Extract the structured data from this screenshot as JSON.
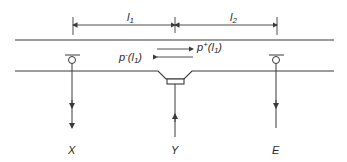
{
  "diagram": {
    "type": "pipeline-schematic",
    "colors": {
      "line": "#3a3a3a",
      "background": "#ffffff"
    },
    "dimensions": {
      "l1": {
        "label": "l",
        "subscript": "1"
      },
      "l2": {
        "label": "l",
        "subscript": "2"
      }
    },
    "flows": {
      "forward": {
        "label": "p",
        "sup": "+",
        "arg": "(l",
        "sub": "1",
        "close": ")"
      },
      "backward": {
        "label": "p",
        "sup": "-",
        "arg": "(l",
        "sub": "1",
        "close": ")"
      }
    },
    "nodes": [
      {
        "id": "X",
        "label": "X",
        "kind": "outlet-valve",
        "arrow": "down"
      },
      {
        "id": "Y",
        "label": "Y",
        "kind": "inlet-junction",
        "arrow": "up"
      },
      {
        "id": "E",
        "label": "E",
        "kind": "outlet-valve",
        "arrow": "down"
      }
    ]
  }
}
